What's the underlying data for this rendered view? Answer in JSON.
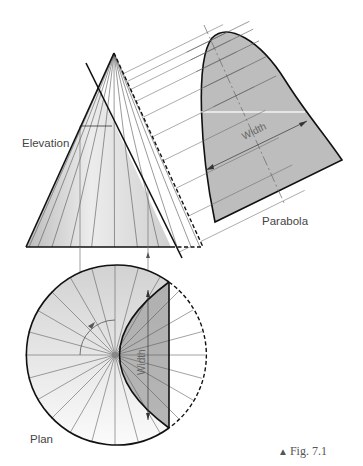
{
  "labels": {
    "elevation": "Elevation",
    "parabola": "Parabola",
    "plan": "Plan",
    "width_top": "Width",
    "width_plan": "Width"
  },
  "caption": {
    "marker": "▲",
    "text": "Fig. 7.1"
  },
  "colors": {
    "outline": "#111111",
    "construction": "#666666",
    "parabola_fill": "#bdbdbd",
    "cone_fill_dark": "#c8c8c8",
    "cone_fill_light": "#f4f4f4",
    "plan_section_fill": "#a9a9a9"
  },
  "geometry": {
    "cone_apex": [
      114,
      53
    ],
    "cone_base_y": 247,
    "cone_base_left_x": 26,
    "cone_base_right_x": 171,
    "cone_dashed_right_x": 203,
    "cutting_plane": [
      [
        86,
        63
      ],
      [
        182,
        258
      ]
    ],
    "plan_center": [
      115,
      355
    ],
    "plan_radius": 90,
    "plan_generators": 24
  }
}
